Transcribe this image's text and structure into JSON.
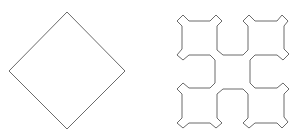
{
  "figure": {
    "width": 300,
    "height": 139,
    "background": "#ffffff",
    "stroke_color": "#6a6a6a",
    "shapes": [
      {
        "name": "diamond",
        "description": "Square rotated 45 degrees (fractal iteration 0)",
        "points": "67,12 125,71 67,129 9,71"
      },
      {
        "name": "fractal-curve",
        "description": "Closed fractal-like curve of four notched squares (next iteration)",
        "points": "189,21 210,21 216,15 222,21 217,26 217,50 223,55 243,55 248,50 248,26 243,21 249,15 255,21 277,21 282,15 288,21 284,26 284,49 289,54 283,60 277,55 255,55 250,60 250,83 255,88 277,88 283,83 289,89 284,94 284,117 288,122 282,128 277,123 255,123 249,128 243,123 248,118 248,94 243,89 223,89 217,94 217,118 222,123 216,128 210,123 189,123 183,128 177,123 182,118 182,94 177,89 183,83 189,88 210,88 215,83 215,60 210,55 189,55 183,60 177,55 182,49 182,26 177,21 183,15"
      }
    ]
  }
}
